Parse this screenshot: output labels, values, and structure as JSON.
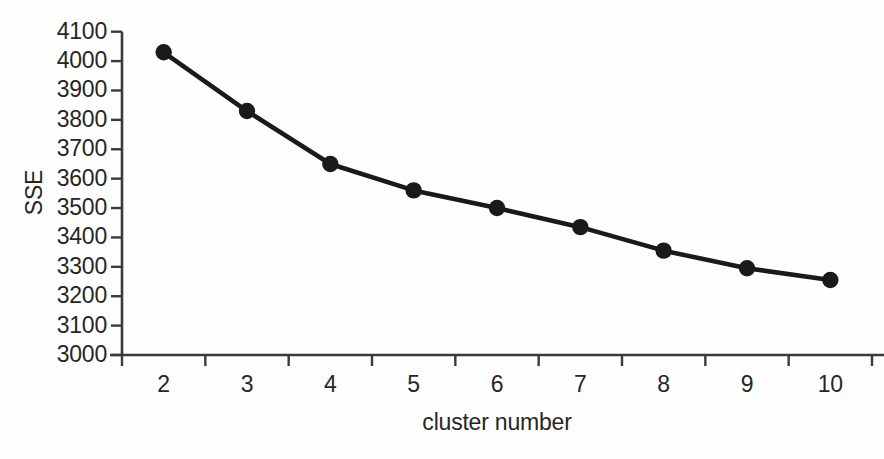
{
  "chart_data": {
    "type": "line",
    "title": "",
    "xlabel": "cluster number",
    "ylabel": "SSE",
    "x": [
      2,
      3,
      4,
      5,
      6,
      7,
      8,
      9,
      10
    ],
    "categories": [
      "2",
      "3",
      "4",
      "5",
      "6",
      "7",
      "8",
      "9",
      "10"
    ],
    "values": [
      4030,
      3830,
      3650,
      3560,
      3500,
      3435,
      3355,
      3295,
      3255
    ],
    "series": [
      {
        "name": "SSE",
        "values": [
          4030,
          3830,
          3650,
          3560,
          3500,
          3435,
          3355,
          3295,
          3255
        ]
      }
    ],
    "ylim": [
      3000,
      4100
    ],
    "yticks": [
      3000,
      3100,
      3200,
      3300,
      3400,
      3500,
      3600,
      3700,
      3800,
      3900,
      4000,
      4100
    ],
    "ytick_labels": [
      "3000",
      "3100",
      "3200",
      "3300",
      "3400",
      "3500",
      "3600",
      "3700",
      "3800",
      "3900",
      "4000",
      "4100"
    ],
    "xtick_labels": [
      "2",
      "3",
      "4",
      "5",
      "6",
      "7",
      "8",
      "9",
      "10"
    ],
    "grid": false,
    "legend": false,
    "legend_position": "none",
    "line_color": "#1a1a1a",
    "marker_color": "#1a1a1a",
    "marker_shape": "circle",
    "axis_color": "#3b3b3b",
    "background_color": "#fefefe"
  }
}
